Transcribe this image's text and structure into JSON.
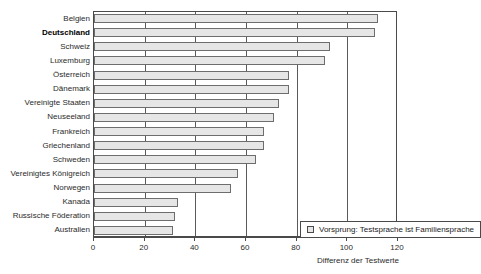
{
  "chart": {
    "title": "",
    "footnote": "",
    "legend": {
      "label": "Vorsprung: Testsprache ist Familiensprache",
      "swatch_name": "legend-swatch"
    },
    "axis_title_x": "Differenz der Testwerte"
  },
  "chart_data": {
    "type": "bar",
    "orientation": "horizontal",
    "title": "",
    "xlabel": "Differenz der Testwerte",
    "ylabel": "",
    "xlim": [
      0,
      120
    ],
    "xticks": [
      0,
      20,
      40,
      60,
      80,
      100,
      120
    ],
    "grid": true,
    "grid_axis": "x",
    "legend": [
      "Vorsprung: Testsprache ist Familiensprache"
    ],
    "legend_position": "lower right inside plot",
    "bar_fill_color": "#e6e6e6",
    "bar_edge_color": "#6d6d6d",
    "highlight_category": "Deutschland",
    "categories": [
      "Belgien",
      "Deutschland",
      "Schweiz",
      "Luxemburg",
      "Österreich",
      "Dänemark",
      "Vereinigte Staaten",
      "Neuseeland",
      "Frankreich",
      "Griechenland",
      "Schweden",
      "Vereinigtes Königreich",
      "Norwegen",
      "Kanada",
      "Russische Föderation",
      "Australien"
    ],
    "values": [
      112,
      111,
      93,
      91,
      77,
      77,
      73,
      71,
      67,
      67,
      64,
      57,
      54,
      33,
      32,
      31
    ]
  }
}
